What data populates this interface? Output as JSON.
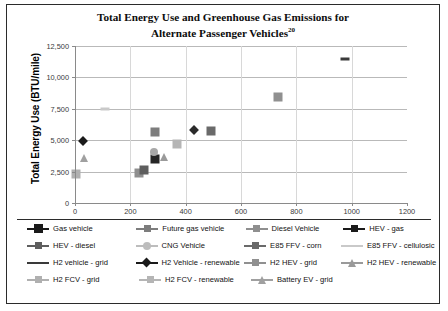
{
  "chart_data": {
    "type": "scatter",
    "title": "Total Energy Use and Greenhouse Gas Emissions for Alternate Passenger Vehicles",
    "title_line1": "Total Energy Use and Greenhouse Gas Emissions for",
    "title_line2": "Alternate Passenger Vehicles",
    "title_superscript": "20",
    "xlabel": "",
    "ylabel": "Total Energy Use (BTU/mile)",
    "xlim": [
      0,
      1200
    ],
    "ylim": [
      0,
      12500
    ],
    "xticks": [
      "0",
      "200",
      "400",
      "600",
      "800",
      "1000",
      "1200"
    ],
    "xtick_values": [
      0,
      200,
      400,
      600,
      800,
      1000,
      1200
    ],
    "yticks": [
      "0",
      "2,500",
      "5,000",
      "7,500",
      "10,000",
      "12,500"
    ],
    "ytick_values": [
      0,
      2500,
      5000,
      7500,
      10000,
      12500
    ],
    "grid": "horizontal",
    "legend_position": "bottom",
    "series": [
      {
        "name": "Gas vehicle",
        "marker": "diamond",
        "color": "#1a1a1a",
        "x": 30,
        "y": 4950
      },
      {
        "name": "Future gas vehicle",
        "marker": "square",
        "color": "#7d7d7d",
        "x": 290,
        "y": 5650
      },
      {
        "name": "Diesel Vehicle",
        "marker": "square",
        "color": "#8f8f8f",
        "x": 230,
        "y": 2400
      },
      {
        "name": "HEV - gas",
        "marker": "square",
        "color": "#262626",
        "x": 290,
        "y": 3500
      },
      {
        "name": "HEV - diesel",
        "marker": "square",
        "color": "#5e5e5e",
        "x": 248,
        "y": 2620
      },
      {
        "name": "CNG Vehicle",
        "marker": "circle",
        "color": "#a8a8a8",
        "x": 287,
        "y": 4100
      },
      {
        "name": "E85 FFV - corn",
        "marker": "square",
        "color": "#6a6a6a",
        "x": 490,
        "y": 5700
      },
      {
        "name": "E85 FFV - cellulosic",
        "marker": "dash",
        "color": "#c9c9c9",
        "x": 110,
        "y": 7450
      },
      {
        "name": "H2 vehicle - grid",
        "marker": "dash",
        "color": "#3a3a3a",
        "x": 975,
        "y": 11500
      },
      {
        "name": "H2 Vehicle - renewable",
        "marker": "diamond",
        "color": "#2b2b2b",
        "x": 430,
        "y": 5850
      },
      {
        "name": "H2 HEV - grid",
        "marker": "square",
        "color": "#909090",
        "x": 735,
        "y": 8450
      },
      {
        "name": "H2 HEV - renewable",
        "marker": "triangle",
        "color": "#9a9a9a",
        "x": 320,
        "y": 3700
      },
      {
        "name": "H2 FCV - grid",
        "marker": "square",
        "color": "#b0b0b0",
        "x": 5,
        "y": 2300
      },
      {
        "name": "H2 FCV - renewable",
        "marker": "square",
        "color": "#b5b5b5",
        "x": 370,
        "y": 4700
      },
      {
        "name": "Battery EV - grid",
        "marker": "triangle",
        "color": "#a0a0a0",
        "x": 33,
        "y": 3600
      }
    ],
    "legend": [
      {
        "label": "Gas vehicle",
        "marker": "plus",
        "color": "#1a1a1a"
      },
      {
        "label": "Future gas vehicle",
        "marker": "square",
        "color": "#7d7d7d"
      },
      {
        "label": "Diesel Vehicle",
        "marker": "square",
        "color": "#8f8f8f"
      },
      {
        "label": "HEV - gas",
        "marker": "square",
        "color": "#1a1a1a"
      },
      {
        "label": "HEV - diesel",
        "marker": "square",
        "color": "#5e5e5e"
      },
      {
        "label": "CNG Vehicle",
        "marker": "circle",
        "color": "#bdbdbd"
      },
      {
        "label": "E85 FFV - corn",
        "marker": "square",
        "color": "#6a6a6a"
      },
      {
        "label": "E85 FFV - cellulosic",
        "marker": "line",
        "color": "#c9c9c9"
      },
      {
        "label": "H2 vehicle - grid",
        "marker": "line",
        "color": "#3a3a3a"
      },
      {
        "label": "H2 Vehicle - renewable",
        "marker": "diamond",
        "color": "#1a1a1a"
      },
      {
        "label": "H2 HEV - grid",
        "marker": "square",
        "color": "#909090"
      },
      {
        "label": "H2 HEV - renewable",
        "marker": "triangle",
        "color": "#9a9a9a"
      },
      {
        "label": "H2 FCV - grid",
        "marker": "square",
        "color": "#b0b0b0"
      },
      {
        "label": "H2 FCV - renewable",
        "marker": "square",
        "color": "#b5b5b5"
      },
      {
        "label": "Battery EV - grid",
        "marker": "triangle",
        "color": "#a0a0a0"
      }
    ]
  }
}
